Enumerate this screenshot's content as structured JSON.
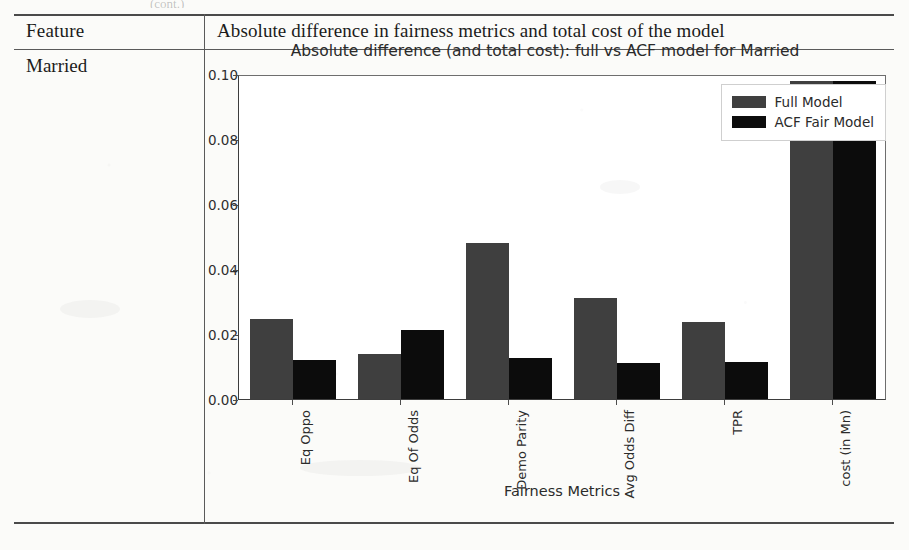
{
  "page": {
    "clipped_header_text": "(cont.)"
  },
  "table": {
    "columns": [
      "Feature",
      "Absolute difference in fairness metrics and total cost of the model"
    ],
    "rows": [
      {
        "feature": "Married"
      }
    ]
  },
  "chart_data": {
    "type": "bar",
    "title": "Absolute difference (and total cost): full vs ACF model for Married",
    "xlabel": "Fairness Metrics",
    "ylabel": "",
    "categories": [
      "Eq Oppo",
      "Eq Of Odds",
      "Demo Parity",
      "Avg Odds Diff",
      "TPR",
      "cost (in Mn)"
    ],
    "series": [
      {
        "name": "Full Model",
        "color": "#3f3f3f",
        "values": [
          0.0245,
          0.014,
          0.048,
          0.0312,
          0.0236,
          0.098
        ]
      },
      {
        "name": "ACF Fair Model",
        "color": "#0c0c0c",
        "values": [
          0.0121,
          0.0212,
          0.0127,
          0.011,
          0.0115,
          0.098
        ]
      }
    ],
    "ylim": [
      0.0,
      0.1
    ],
    "yticks": [
      0.0,
      0.02,
      0.04,
      0.06,
      0.08,
      0.1
    ],
    "ytick_labels": [
      "0.00",
      "0.02",
      "0.04",
      "0.06",
      "0.08",
      "0.10"
    ],
    "grid": false,
    "legend_position": "upper right",
    "xtick_rotation": 90
  }
}
